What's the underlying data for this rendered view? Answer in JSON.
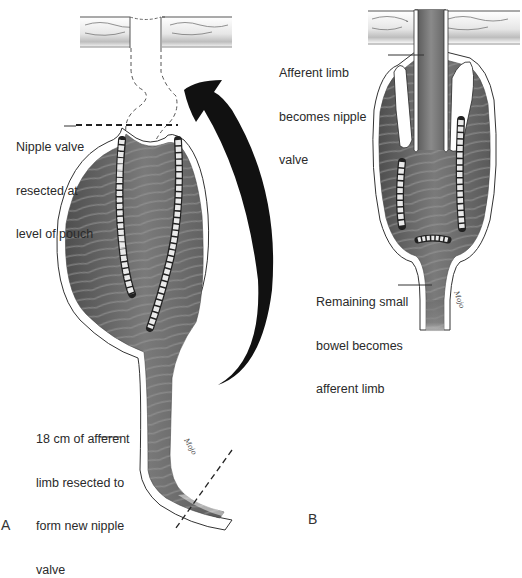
{
  "figure": {
    "panels": [
      {
        "id": "A",
        "letter": "A",
        "labels": {
          "nipple_valve": [
            "Nipple valve",
            "resected at",
            "level of pouch"
          ],
          "afferent_limb": [
            "18 cm of afferent",
            "limb resected to",
            "form new nipple",
            "valve"
          ]
        }
      },
      {
        "id": "B",
        "letter": "B",
        "labels": {
          "afferent_becomes": [
            "Afferent limb",
            "becomes nipple",
            "valve"
          ],
          "remaining_bowel": [
            "Remaining small",
            "bowel becomes",
            "afferent limb"
          ]
        }
      }
    ]
  }
}
